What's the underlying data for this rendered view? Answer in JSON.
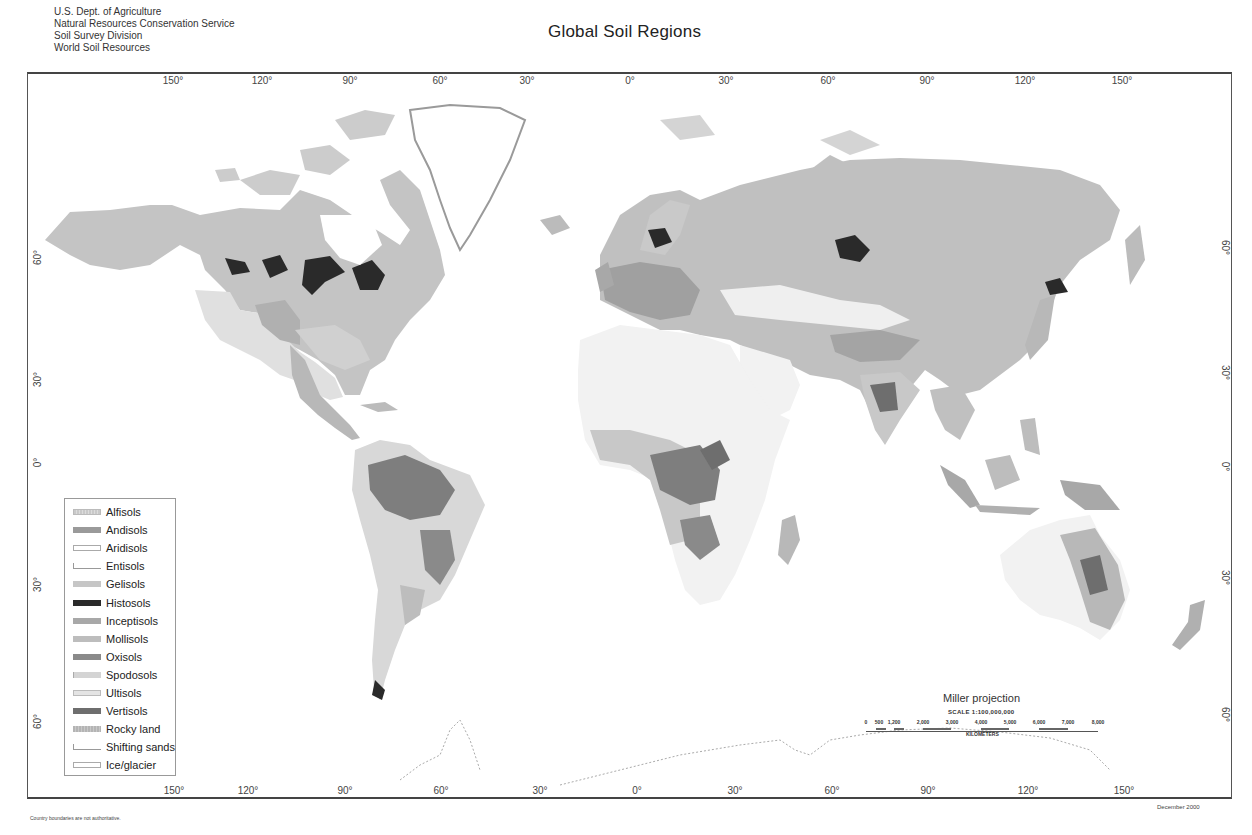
{
  "header": {
    "agency_lines": [
      "U.S. Dept. of Agriculture",
      "Natural Resources Conservation Service",
      "Soil Survey Division",
      "World Soil Resources"
    ],
    "title": "Global Soil Regions"
  },
  "graticule": {
    "top_longitudes": [
      {
        "label": "150°",
        "x": 173
      },
      {
        "label": "120°",
        "x": 262
      },
      {
        "label": "90°",
        "x": 350
      },
      {
        "label": "60°",
        "x": 440
      },
      {
        "label": "30°",
        "x": 527
      },
      {
        "label": "0°",
        "x": 617
      },
      {
        "label": "30°",
        "x": 706
      },
      {
        "label": "60°",
        "x": 796
      },
      {
        "label": "90°",
        "x": 885
      },
      {
        "label": "120°",
        "x": 973
      },
      {
        "label": "150°",
        "x": 1062
      }
    ],
    "bottom_longitudes": [
      {
        "label": "150°",
        "x": 174
      },
      {
        "label": "120°",
        "x": 263
      },
      {
        "label": "90°",
        "x": 352
      },
      {
        "label": "60°",
        "x": 441
      },
      {
        "label": "30°",
        "x": 540
      },
      {
        "label": "0°",
        "x": 640
      },
      {
        "label": "30°",
        "x": 738
      },
      {
        "label": "60°",
        "x": 834
      },
      {
        "label": "90°",
        "x": 928
      },
      {
        "label": "120°",
        "x": 1028
      },
      {
        "label": "150°",
        "x": 1124
      }
    ],
    "left_latitudes": [
      {
        "label": "60°",
        "y": 258
      },
      {
        "label": "30°",
        "y": 380
      },
      {
        "label": "0°",
        "y": 463
      },
      {
        "label": "30°",
        "y": 585
      },
      {
        "label": "60°",
        "y": 722
      }
    ],
    "right_latitudes": [
      {
        "label": "60°",
        "y": 248
      },
      {
        "label": "30°",
        "y": 373
      },
      {
        "label": "0°",
        "y": 467
      },
      {
        "label": "30°",
        "y": 578
      },
      {
        "label": "60°",
        "y": 715
      }
    ]
  },
  "legend": {
    "items": [
      {
        "label": "Alfisols",
        "color": "#cfcfcf",
        "pattern": "dotted"
      },
      {
        "label": "Andisols",
        "color": "#9a9a9a",
        "pattern": "solid"
      },
      {
        "label": "Aridisols",
        "color": "#ffffff",
        "pattern": "outline"
      },
      {
        "label": "Entisols",
        "color": "#ffffff",
        "pattern": "bracket"
      },
      {
        "label": "Gelisols",
        "color": "#c6c6c6",
        "pattern": "solid"
      },
      {
        "label": "Histosols",
        "color": "#2a2a2a",
        "pattern": "solid"
      },
      {
        "label": "Inceptisols",
        "color": "#a8a8a8",
        "pattern": "solid"
      },
      {
        "label": "Mollisols",
        "color": "#bdbdbd",
        "pattern": "solid"
      },
      {
        "label": "Oxisols",
        "color": "#8a8a8a",
        "pattern": "solid"
      },
      {
        "label": "Spodosols",
        "color": "#d4d4d4",
        "pattern": "solid"
      },
      {
        "label": "Ultisols",
        "color": "#e4e4e4",
        "pattern": "outline"
      },
      {
        "label": "Vertisols",
        "color": "#6e6e6e",
        "pattern": "solid"
      },
      {
        "label": "Rocky land",
        "color": "#b4b4b4",
        "pattern": "solid"
      },
      {
        "label": "Shifting sands",
        "color": "#ffffff",
        "pattern": "bracket"
      },
      {
        "label": "Ice/glacier",
        "color": "#ffffff",
        "pattern": "outline"
      }
    ]
  },
  "scale": {
    "projection": "Miller projection",
    "scale_text": "SCALE 1:100,000,000",
    "ticks": [
      {
        "label": "0",
        "x": 2
      },
      {
        "label": "500",
        "x": 15
      },
      {
        "label": "1,200",
        "x": 30
      },
      {
        "label": "2,000",
        "x": 59
      },
      {
        "label": "3,000",
        "x": 88
      },
      {
        "label": "4,000",
        "x": 117
      },
      {
        "label": "5,000",
        "x": 146
      },
      {
        "label": "6,000",
        "x": 175
      },
      {
        "label": "7,000",
        "x": 204
      },
      {
        "label": "8,000",
        "x": 234
      }
    ],
    "unit": "KILOMETERS"
  },
  "footer": {
    "note": "Country boundaries are not authoritative.",
    "date": "December 2000"
  }
}
